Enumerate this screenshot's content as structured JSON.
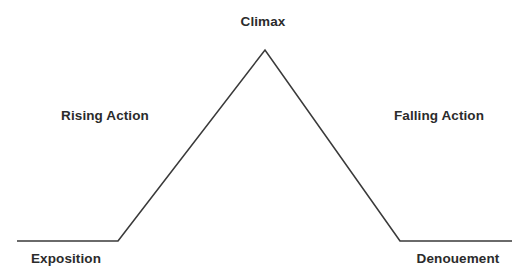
{
  "canvas": {
    "width": 519,
    "height": 278,
    "background_color": "#ffffff"
  },
  "diagram": {
    "name": "plot-diagram",
    "type": "freytag-pyramid",
    "line_color": "#3a3a3a",
    "line_width": 1.6,
    "points": [
      {
        "x": 17,
        "y": 241,
        "name": "left-baseline-start"
      },
      {
        "x": 118,
        "y": 241,
        "name": "rising-action-foot"
      },
      {
        "x": 265,
        "y": 50,
        "name": "climax-apex"
      },
      {
        "x": 400,
        "y": 241,
        "name": "falling-action-foot"
      },
      {
        "x": 512,
        "y": 241,
        "name": "right-baseline-end"
      }
    ],
    "path": "M 17 241 L 118 241 L 265 50 L 400 241 L 512 241"
  },
  "labels": {
    "climax": "Climax",
    "rising_action": "Rising Action",
    "falling_action": "Falling Action",
    "exposition": "Exposition",
    "denouement": "Denouement"
  },
  "chart_data": {
    "type": "line",
    "title": "",
    "xlabel": "",
    "ylabel": "",
    "grid": false,
    "legend": "none",
    "xlim": [
      0,
      519
    ],
    "ylim": [
      278,
      0
    ],
    "annotations": [
      {
        "text": "Climax",
        "x": 263,
        "y": 22
      },
      {
        "text": "Rising Action",
        "x": 105,
        "y": 116
      },
      {
        "text": "Falling Action",
        "x": 439,
        "y": 116
      },
      {
        "text": "Exposition",
        "x": 66,
        "y": 259
      },
      {
        "text": "Denouement",
        "x": 458,
        "y": 259
      }
    ],
    "series": [
      {
        "name": "narrative-arc",
        "color": "#3a3a3a",
        "x": [
          17,
          118,
          265,
          400,
          512
        ],
        "y": [
          241,
          241,
          50,
          241,
          241
        ]
      }
    ]
  }
}
